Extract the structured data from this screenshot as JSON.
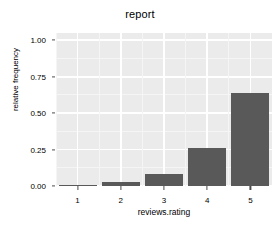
{
  "chart_data": {
    "type": "bar",
    "title": "report",
    "xlabel": "reviews.rating",
    "ylabel": "relative frequency",
    "categories": [
      "1",
      "2",
      "3",
      "4",
      "5"
    ],
    "values": [
      0.01,
      0.03,
      0.08,
      0.26,
      0.64
    ],
    "ylim": [
      0.0,
      1.05
    ],
    "y_ticks": [
      "0.00",
      "0.25",
      "0.50",
      "0.75",
      "1.00"
    ],
    "y_tick_values": [
      0.0,
      0.25,
      0.5,
      0.75,
      1.0
    ],
    "x_ticks": [
      "1",
      "2",
      "3",
      "4",
      "5"
    ],
    "grid": true,
    "legend": "none",
    "colors": {
      "bar_fill": "#595959",
      "panel_background": "#EBEBEB",
      "major_gridline": "#FFFFFF",
      "minor_gridline": "#F5F5F5",
      "text": "#000000",
      "tick_mark": "#4D4D4D",
      "figure_background": "#FFFFFF"
    }
  }
}
